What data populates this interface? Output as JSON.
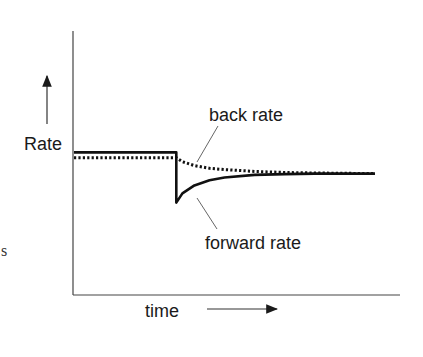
{
  "chart_data": {
    "type": "line",
    "title": "",
    "xlabel": "time",
    "ylabel": "Rate",
    "grid": false,
    "xlim": [
      0,
      100
    ],
    "ylim": [
      0,
      100
    ],
    "annotations": [
      {
        "text": "back rate",
        "target_series": "back rate"
      },
      {
        "text": "forward rate",
        "target_series": "forward rate"
      }
    ],
    "step_time": 34,
    "series": [
      {
        "name": "forward rate",
        "style": "solid",
        "x": [
          0,
          34,
          34,
          36,
          40,
          45,
          50,
          60,
          70,
          80,
          90,
          100
        ],
        "y": [
          54,
          54,
          35,
          38.5,
          41.5,
          43.5,
          44.5,
          45.5,
          45.8,
          46,
          46,
          46
        ]
      },
      {
        "name": "back rate",
        "style": "dotted",
        "x": [
          0,
          34,
          36,
          40,
          45,
          50,
          60,
          70,
          80,
          90,
          100
        ],
        "y": [
          52,
          52,
          50.5,
          49,
          48,
          47.5,
          46.8,
          46.4,
          46.2,
          46.1,
          46
        ]
      }
    ]
  },
  "stray_text": "s"
}
